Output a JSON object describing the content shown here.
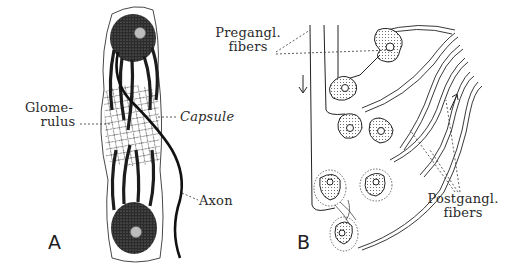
{
  "figure": {
    "panels": [
      {
        "id": "A",
        "label": "A",
        "annotations": {
          "glomerulus_line1": "Glome-",
          "glomerulus_line2": "rulus",
          "capsule": "Capsule",
          "axon": "Axon"
        }
      },
      {
        "id": "B",
        "label": "B",
        "annotations": {
          "pregangl_line1": "Pregangl.",
          "pregangl_line2": "fibers",
          "postgangl_line1": "Postgangl.",
          "postgangl_line2": "fibers"
        }
      }
    ],
    "colors": {
      "ink": "#1a1a1a",
      "stipple": "#555555",
      "background": "#ffffff"
    }
  }
}
